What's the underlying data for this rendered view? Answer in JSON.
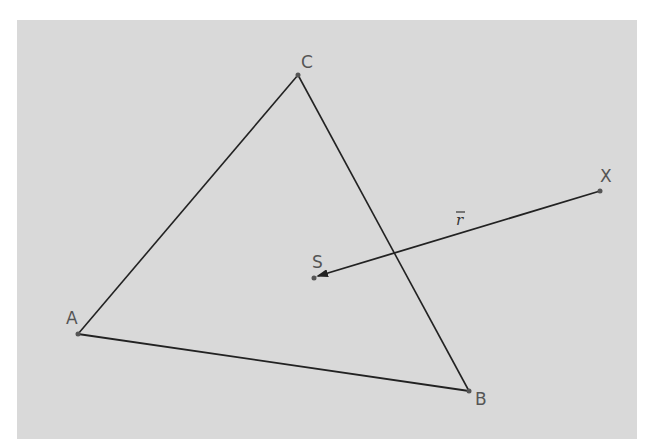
{
  "figure": {
    "background_color": "#d9d9d9",
    "line_color": "#222222",
    "points": {
      "A": {
        "label": "A",
        "x": 78,
        "y": 334
      },
      "B": {
        "label": "B",
        "x": 469,
        "y": 391
      },
      "C": {
        "label": "C",
        "x": 298,
        "y": 75
      },
      "S": {
        "label": "S",
        "x": 314,
        "y": 278
      },
      "X": {
        "label": "X",
        "x": 600,
        "y": 191
      }
    },
    "triangle": {
      "vertices": [
        "A",
        "B",
        "C"
      ]
    },
    "vector": {
      "label": "r",
      "from": "X",
      "to": "S",
      "arrow": "vec-r"
    }
  }
}
